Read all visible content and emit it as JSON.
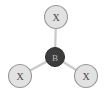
{
  "figure": {
    "background_color": "#ffffff",
    "width": 106,
    "height": 92
  },
  "colors": {
    "center_atom_fill": "#3c3c3c",
    "center_atom_stroke": "#2b2b2b",
    "center_label": "#b9b9b9",
    "ligand_fill": "#e2e2e2",
    "ligand_stroke": "#9a9a9a",
    "ligand_label": "#4a4a4a",
    "bond": "#c9c9c9"
  },
  "atoms": {
    "center": {
      "label": "B",
      "cx": 55,
      "cy": 57,
      "r": 9.5
    },
    "ligands": [
      {
        "label": "X",
        "position": "top",
        "cx": 56,
        "cy": 17,
        "r": 11.5
      },
      {
        "label": "X",
        "position": "bottom-left",
        "cx": 20,
        "cy": 76,
        "r": 11.5
      },
      {
        "label": "X",
        "position": "bottom-right",
        "cx": 86,
        "cy": 76,
        "r": 11.5
      }
    ]
  },
  "bonds": [
    {
      "name": "bond-center-top",
      "x1": 55,
      "y1": 57,
      "x2": 56,
      "y2": 17
    },
    {
      "name": "bond-center-bottom-left",
      "x1": 55,
      "y1": 57,
      "x2": 20,
      "y2": 76
    },
    {
      "name": "bond-center-bottom-right",
      "x1": 55,
      "y1": 57,
      "x2": 86,
      "y2": 76
    }
  ]
}
